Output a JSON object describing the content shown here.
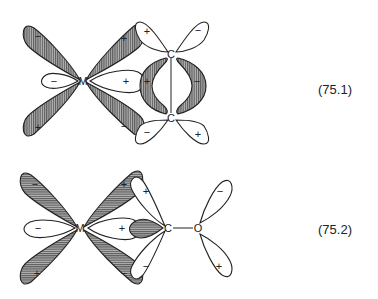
{
  "figure": {
    "top": {
      "equation_label": "(75.1)",
      "atoms": {
        "metal": "M",
        "carbon_1": "C",
        "carbon_2": "C"
      },
      "signs": {
        "d_upper_left": "−",
        "d_upper_right": "+",
        "d_lower_left": "+",
        "d_lower_right": "−",
        "sigma_left": "−",
        "sigma_right": "+",
        "pi_left": "+",
        "pi_right": "−",
        "c1_left": "+",
        "c1_right": "−",
        "c2_left": "−",
        "c2_right": "+"
      },
      "hatching": "vertical"
    },
    "bottom": {
      "equation_label": "(75.2)",
      "atoms": {
        "metal": "M",
        "carbon": "C",
        "oxygen": "O"
      },
      "signs": {
        "d_upper_left": "−",
        "d_upper_right": "+",
        "d_lower_left": "+",
        "d_lower_right": "−",
        "sigma_left": "−",
        "sigma_right": "+",
        "c_upper": "+",
        "c_lower": "−",
        "o_upper": "−",
        "o_lower": "+"
      },
      "hatching": "horizontal"
    },
    "colors": {
      "line": "#222222",
      "shade": "#888888",
      "background": "#ffffff"
    }
  }
}
